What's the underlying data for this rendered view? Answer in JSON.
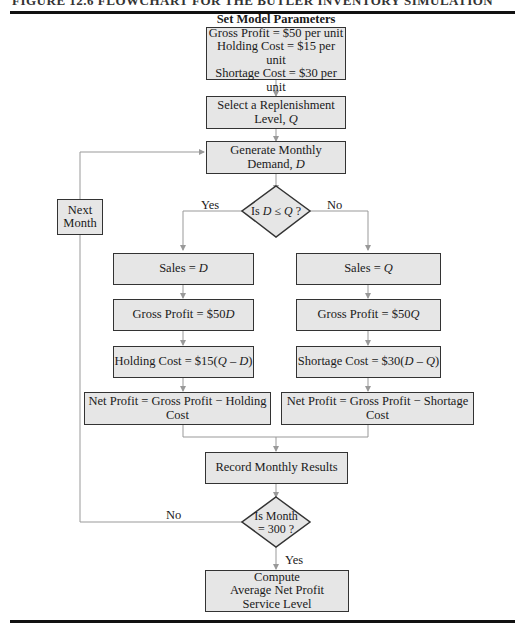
{
  "header": {
    "title": "FIGURE 12.6   FLOWCHART FOR THE BUTLER INVENTORY SIMULATION"
  },
  "flowchart": {
    "params": {
      "title": "Set Model Parameters",
      "lines": [
        "Gross Profit = $50 per unit",
        "Holding Cost = $15 per unit",
        "Shortage Cost = $30 per unit"
      ]
    },
    "select_q": {
      "line1": "Select a Replenishment",
      "line2_prefix": "Level, ",
      "line2_var": "Q"
    },
    "generate_d": {
      "line1": "Generate Monthly",
      "line2_prefix": "Demand, ",
      "line2_var": "D"
    },
    "decision1": {
      "prefix": "Is ",
      "var1": "D",
      "op": " ≤ ",
      "var2": "Q",
      "suffix": " ?",
      "yes": "Yes",
      "no": "No"
    },
    "next_month": {
      "line1": "Next",
      "line2": "Month"
    },
    "left": {
      "sales": {
        "prefix": "Sales = ",
        "var": "D"
      },
      "gross": {
        "prefix": "Gross Profit = $50",
        "var": "D"
      },
      "holding": {
        "prefix": "Holding Cost = $15(",
        "var1": "Q",
        "op": " – ",
        "var2": "D",
        "suffix": ")"
      },
      "net": "Net Profit = Gross Profit − Holding Cost"
    },
    "right": {
      "sales": {
        "prefix": "Sales = ",
        "var": "Q"
      },
      "gross": {
        "prefix": "Gross Profit = $50",
        "var": "Q"
      },
      "shortage": {
        "prefix": "Shortage Cost = $30(",
        "var1": "D",
        "op": " – ",
        "var2": "Q",
        "suffix": ")"
      },
      "net": "Net Profit = Gross Profit − Shortage Cost"
    },
    "record": "Record Monthly Results",
    "decision2": {
      "line1": "Is Month",
      "line2": "= 300 ?",
      "yes": "Yes",
      "no": "No"
    },
    "compute": {
      "line1": "Compute",
      "line2": "Average Net Profit",
      "line3": "Service Level"
    }
  },
  "colors": {
    "box_fill": "#e6e6e6",
    "box_border": "#333333",
    "connector": "#999999"
  }
}
